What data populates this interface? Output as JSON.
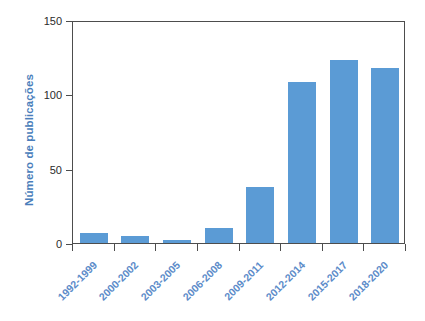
{
  "chart_data": {
    "type": "bar",
    "title": "",
    "xlabel": "",
    "ylabel": "Número de publicações",
    "ylim": [
      0,
      150
    ],
    "yticks": [
      "0",
      "50",
      "100",
      "150"
    ],
    "ytick_values": [
      0,
      50,
      100,
      150
    ],
    "grid": false,
    "legend": null,
    "categories": [
      "1992-1999",
      "2000-2002",
      "2003-2005",
      "2006-2008",
      "2009-2011",
      "2012-2014",
      "2015-2017",
      "2018-2020"
    ],
    "values": [
      7,
      5,
      2,
      10,
      38,
      108,
      123,
      118
    ],
    "bar_color": "#5b9bd5",
    "label_color": "#5b8bc9",
    "axis_color": "#4d4d4d"
  }
}
